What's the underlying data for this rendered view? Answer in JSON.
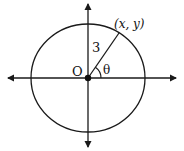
{
  "diagram": {
    "type": "unit-circle-polar",
    "labels": {
      "origin": "O",
      "radius": "3",
      "angle": "θ",
      "point": "(x, y)"
    },
    "geometry": {
      "center": [
        88,
        78
      ],
      "circle_rx": 57,
      "circle_ry": 54,
      "point_on_circle": [
        119,
        33
      ],
      "x_axis": {
        "from": [
          8,
          78
        ],
        "to": [
          176,
          78
        ]
      },
      "y_axis": {
        "from": [
          88,
          4
        ],
        "to": [
          88,
          147
        ]
      }
    },
    "colors": {
      "stroke": "#1a1a1a",
      "background": "#ffffff"
    }
  }
}
